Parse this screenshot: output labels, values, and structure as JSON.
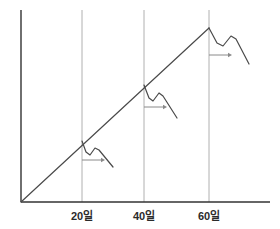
{
  "chart_data": {
    "type": "line",
    "title": "",
    "xlabel": "",
    "ylabel": "",
    "grid": true,
    "legend": null,
    "xlim": [
      0,
      80
    ],
    "ylim": [
      0,
      100
    ],
    "axis_color": "#333333",
    "gridline_color": "#b0b0b0",
    "series_color": "#4a4a4a",
    "arrow_color": "#8a8a8a",
    "x_ticks": [
      {
        "value": 20,
        "label": "20일",
        "pixel_x": 82
      },
      {
        "value": 40,
        "label": "40일",
        "pixel_x": 144
      },
      {
        "value": 60,
        "label": "60일",
        "pixel_x": 209
      }
    ],
    "y_ticks": [],
    "series": [
      {
        "name": "trend-line",
        "type": "line",
        "description": "Straight rising diagonal trend line from origin to the 60일 gridline peak",
        "points": [
          {
            "x": 0,
            "y": 0
          },
          {
            "x": 60,
            "y": 90
          }
        ],
        "pixel_points": [
          {
            "x": 21,
            "y": 202
          },
          {
            "x": 209,
            "y": 28
          }
        ]
      },
      {
        "name": "branch-20",
        "type": "line",
        "description": "Decaying squiggle branching off the trend line at the 20일 gridline: dip, small rebound, then decline",
        "pixel_points": [
          {
            "x": 82,
            "y": 141
          },
          {
            "x": 86,
            "y": 152
          },
          {
            "x": 90,
            "y": 155
          },
          {
            "x": 95,
            "y": 148
          },
          {
            "x": 99,
            "y": 150
          },
          {
            "x": 113,
            "y": 167
          }
        ]
      },
      {
        "name": "branch-40",
        "type": "line",
        "description": "Decaying squiggle branching off the trend line at the 40일 gridline: dip, small rebound, then decline",
        "pixel_points": [
          {
            "x": 144,
            "y": 85
          },
          {
            "x": 149,
            "y": 98
          },
          {
            "x": 153,
            "y": 101
          },
          {
            "x": 159,
            "y": 93
          },
          {
            "x": 163,
            "y": 96
          },
          {
            "x": 177,
            "y": 118
          }
        ]
      },
      {
        "name": "branch-60",
        "type": "line",
        "description": "Decaying squiggle branching off the trend line at the 60일 gridline peak: dip, small rebound, then decline",
        "pixel_points": [
          {
            "x": 209,
            "y": 28
          },
          {
            "x": 217,
            "y": 43
          },
          {
            "x": 223,
            "y": 46
          },
          {
            "x": 231,
            "y": 36
          },
          {
            "x": 236,
            "y": 39
          },
          {
            "x": 249,
            "y": 64
          }
        ]
      }
    ],
    "annotations": [
      {
        "name": "arrow-20",
        "type": "arrow-right",
        "from": {
          "x": 82,
          "y": 160
        },
        "to": {
          "x": 105,
          "y": 160
        }
      },
      {
        "name": "arrow-40",
        "type": "arrow-right",
        "from": {
          "x": 144,
          "y": 107
        },
        "to": {
          "x": 167,
          "y": 107
        }
      },
      {
        "name": "arrow-60",
        "type": "arrow-right",
        "from": {
          "x": 209,
          "y": 55
        },
        "to": {
          "x": 232,
          "y": 55
        }
      }
    ],
    "axes_pixels": {
      "y_axis": {
        "x": 21,
        "y_top": 10,
        "y_bottom": 202
      },
      "x_axis": {
        "y": 202,
        "x_left": 21,
        "x_right": 270
      },
      "gridline_top": 10
    }
  },
  "labels": {
    "tick_0": "20일",
    "tick_1": "40일",
    "tick_2": "60일"
  }
}
